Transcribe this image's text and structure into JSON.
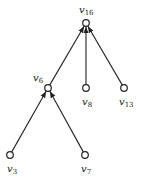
{
  "diagram": {
    "type": "directed-tree",
    "nodes": [
      {
        "id": "v16",
        "base": "v",
        "sub": "16",
        "x": 86,
        "y": 23,
        "lx": 79,
        "ly": 13
      },
      {
        "id": "v6",
        "base": "v",
        "sub": "6",
        "x": 48,
        "y": 88,
        "lx": 33,
        "ly": 81
      },
      {
        "id": "v8",
        "base": "v",
        "sub": "8",
        "x": 86,
        "y": 88,
        "lx": 82,
        "ly": 105
      },
      {
        "id": "v13",
        "base": "v",
        "sub": "13",
        "x": 124,
        "y": 88,
        "lx": 119,
        "ly": 105
      },
      {
        "id": "v3",
        "base": "v",
        "sub": "3",
        "x": 10,
        "y": 155,
        "lx": 7,
        "ly": 172
      },
      {
        "id": "v7",
        "base": "v",
        "sub": "7",
        "x": 85,
        "y": 155,
        "lx": 81,
        "ly": 172
      }
    ],
    "edges": [
      {
        "from": "v6",
        "to": "v16"
      },
      {
        "from": "v8",
        "to": "v16"
      },
      {
        "from": "v13",
        "to": "v16"
      },
      {
        "from": "v3",
        "to": "v6"
      },
      {
        "from": "v7",
        "to": "v6"
      }
    ]
  }
}
